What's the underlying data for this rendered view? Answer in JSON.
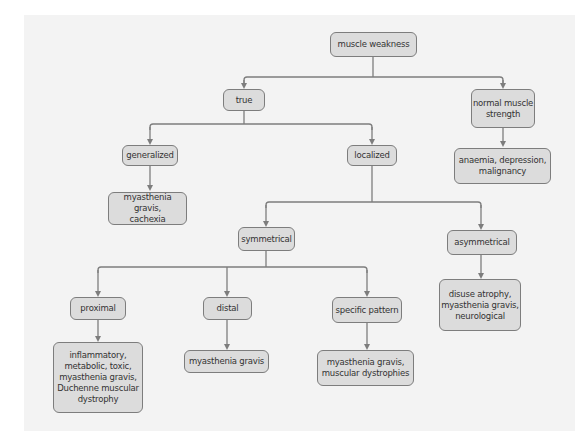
{
  "diagram": {
    "type": "flowchart",
    "colors": {
      "background": "#ffffff",
      "panel": "#f3f3f3",
      "node_fill": "#dcdcdc",
      "node_border": "#7d7d7d",
      "connector": "#7d7d7d",
      "text": "#333333"
    },
    "nodes": {
      "muscle_weakness": "muscle weakness",
      "true": "true",
      "normal_strength": "normal muscle\nstrength",
      "normal_causes": "anaemia, depression,\nmalignancy",
      "generalized": "generalized",
      "generalized_causes": "myasthenia gravis,\ncachexia",
      "localized": "localized",
      "symmetrical": "symmetrical",
      "asymmetrical": "asymmetrical",
      "asymmetrical_causes": "disuse atrophy,\nmyasthenia gravis,\nneurological",
      "proximal": "proximal",
      "proximal_causes": "inflammatory,\nmetabolic, toxic,\nmyasthenia gravis,\nDuchenne muscular\ndystrophy",
      "distal": "distal",
      "distal_causes": "myasthenia gravis",
      "specific_pattern": "specific pattern",
      "specific_causes": "myasthenia gravis,\nmuscular dystrophies"
    },
    "edges": [
      [
        "muscle weakness",
        "true"
      ],
      [
        "muscle weakness",
        "normal muscle strength"
      ],
      [
        "normal muscle strength",
        "anaemia, depression, malignancy"
      ],
      [
        "true",
        "generalized"
      ],
      [
        "true",
        "localized"
      ],
      [
        "generalized",
        "myasthenia gravis, cachexia"
      ],
      [
        "localized",
        "symmetrical"
      ],
      [
        "localized",
        "asymmetrical"
      ],
      [
        "asymmetrical",
        "disuse atrophy, myasthenia gravis, neurological"
      ],
      [
        "symmetrical",
        "proximal"
      ],
      [
        "symmetrical",
        "distal"
      ],
      [
        "symmetrical",
        "specific pattern"
      ],
      [
        "proximal",
        "inflammatory, metabolic, toxic, myasthenia gravis, Duchenne muscular dystrophy"
      ],
      [
        "distal",
        "myasthenia gravis"
      ],
      [
        "specific pattern",
        "myasthenia gravis, muscular dystrophies"
      ]
    ]
  }
}
